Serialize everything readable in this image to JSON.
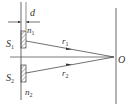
{
  "diagram": {
    "labels": {
      "d": "d",
      "n1": "n",
      "n1_sub": "1",
      "n2": "n",
      "n2_sub": "2",
      "S1": "S",
      "S1_sub": "1",
      "S2": "S",
      "S2_sub": "2",
      "r1": "r",
      "r1_sub": "1",
      "r2": "r",
      "r2_sub": "2",
      "O": "O"
    },
    "colors": {
      "line": "#444444",
      "text": "#333333"
    }
  }
}
